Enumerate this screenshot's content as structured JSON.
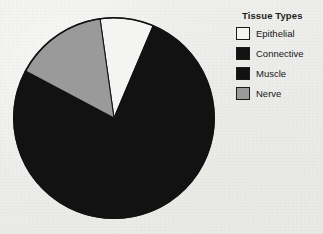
{
  "chart_data": {
    "type": "pie",
    "title": "",
    "legend_title": "Tissue Types",
    "legend_position": "right",
    "categories": [
      "Epithelial",
      "Connective",
      "Muscle",
      "Nerve"
    ],
    "values": [
      8.6,
      31.0,
      45.3,
      15.1
    ],
    "value_unit": "percent",
    "start_angle_deg": 352,
    "direction": "clockwise",
    "slice_angles_deg": [
      31,
      112,
      163,
      54
    ],
    "slice_colors": [
      "#f4f4f2",
      "#121212",
      "#121212",
      "#9a9a9a"
    ],
    "slice_edge_color": "#121212",
    "slices": [
      {
        "label": "Epithelial",
        "value": 8.6,
        "color": "#f4f4f2",
        "start_deg": 352,
        "end_deg": 23
      },
      {
        "label": "Connective",
        "value": 31.0,
        "color": "#121212",
        "start_deg": 23,
        "end_deg": 135
      },
      {
        "label": "Muscle",
        "value": 45.3,
        "color": "#121212",
        "start_deg": 135,
        "end_deg": 298
      },
      {
        "label": "Nerve",
        "value": 15.1,
        "color": "#9a9a9a",
        "start_deg": 298,
        "end_deg": 352
      }
    ],
    "grid": false,
    "xlabel": "",
    "ylabel": ""
  },
  "legend": {
    "title": "Tissue Types",
    "items": [
      {
        "label": "Epithelial",
        "color": "#f4f4f2"
      },
      {
        "label": "Connective",
        "color": "#121212"
      },
      {
        "label": "Muscle",
        "color": "#121212"
      },
      {
        "label": "Nerve",
        "color": "#9a9a9a"
      }
    ]
  },
  "colors": {
    "background": "#eeeeec",
    "outline": "#121212",
    "white_slice": "#f4f4f2",
    "black_slice": "#121212",
    "gray_slice": "#9a9a9a",
    "text": "#171717"
  }
}
